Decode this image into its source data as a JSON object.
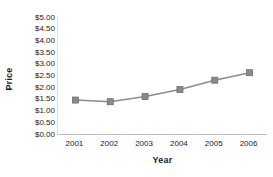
{
  "chart_data": {
    "type": "line",
    "title": "",
    "xlabel": "Year",
    "ylabel": "Price",
    "categories": [
      "2001",
      "2002",
      "2003",
      "2004",
      "2005",
      "2006"
    ],
    "values": [
      1.45,
      1.38,
      1.6,
      1.9,
      2.3,
      2.62
    ],
    "series": [
      {
        "name": "Price",
        "values": [
          1.45,
          1.38,
          1.6,
          1.9,
          2.3,
          2.62
        ]
      }
    ],
    "ylim": [
      0,
      5
    ],
    "ytick_step": 0.5,
    "ytick_labels": [
      "$5.00",
      "$4.50",
      "$4.00",
      "$3.50",
      "$3.00",
      "$2.50",
      "$2.00",
      "$1.50",
      "$1.00",
      "$0.50",
      "$0.00"
    ],
    "ytick_values": [
      5.0,
      4.5,
      4.0,
      3.5,
      3.0,
      2.5,
      2.0,
      1.5,
      1.0,
      0.5,
      0.0
    ],
    "xtick_labels": [
      "2001",
      "2002",
      "2003",
      "2004",
      "2005",
      "2006"
    ],
    "grid": false,
    "legend": false,
    "legend_position": "none",
    "colors": {
      "line": "#8c8c8c",
      "marker_fill": "#8a8a8a",
      "marker_edge": "#6e6e6e",
      "axis": "#b8b8b8",
      "text": "#1a1a1a",
      "background": "#ffffff"
    },
    "marker_shape": "square",
    "annotations": []
  }
}
